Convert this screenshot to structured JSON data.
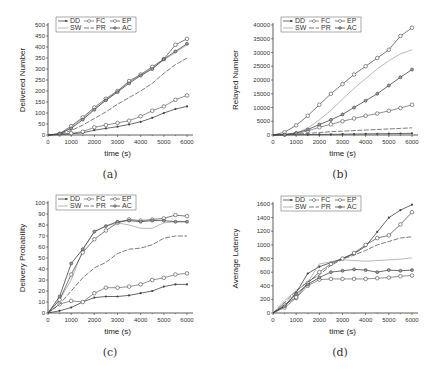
{
  "chart_data": [
    {
      "id": "a",
      "type": "line",
      "caption": "(a)",
      "xlabel": "time (s)",
      "ylabel": "Delivered Number",
      "x": [
        0,
        500,
        1000,
        1500,
        2000,
        2500,
        3000,
        3500,
        4000,
        4500,
        5000,
        5500,
        6000
      ],
      "xticks": [
        0,
        1000,
        2000,
        3000,
        4000,
        5000,
        6000
      ],
      "yticks": [
        0,
        50,
        100,
        150,
        200,
        250,
        300,
        350,
        400,
        450,
        500
      ],
      "xlim": [
        0,
        6000
      ],
      "ylim": [
        0,
        500
      ],
      "legend": [
        "DD",
        "SW",
        "FC",
        "PR",
        "EP",
        "AC"
      ],
      "series": [
        {
          "name": "DD",
          "marker": "star",
          "values": [
            0,
            2,
            5,
            10,
            22,
            30,
            38,
            48,
            60,
            78,
            100,
            118,
            130
          ]
        },
        {
          "name": "SW",
          "marker": "none",
          "values": [
            0,
            5,
            35,
            75,
            118,
            160,
            200,
            240,
            272,
            305,
            340,
            375,
            410
          ]
        },
        {
          "name": "FC",
          "marker": "circle",
          "values": [
            0,
            3,
            8,
            15,
            35,
            45,
            55,
            65,
            85,
            110,
            130,
            160,
            180
          ]
        },
        {
          "name": "PR",
          "marker": "dash",
          "values": [
            0,
            3,
            20,
            45,
            75,
            105,
            140,
            170,
            200,
            235,
            280,
            320,
            350
          ]
        },
        {
          "name": "EP",
          "marker": "circle",
          "values": [
            0,
            6,
            40,
            80,
            125,
            165,
            200,
            245,
            275,
            310,
            345,
            410,
            437
          ]
        },
        {
          "name": "AC",
          "marker": "diamond",
          "values": [
            0,
            5,
            30,
            70,
            115,
            158,
            195,
            235,
            270,
            300,
            345,
            380,
            415
          ]
        }
      ]
    },
    {
      "id": "b",
      "type": "line",
      "caption": "(b)",
      "xlabel": "time (s)",
      "ylabel": "Relayed Number",
      "x": [
        0,
        500,
        1000,
        1500,
        2000,
        2500,
        3000,
        3500,
        4000,
        4500,
        5000,
        5500,
        6000
      ],
      "xticks": [
        0,
        1000,
        2000,
        3000,
        4000,
        5000,
        6000
      ],
      "yticks": [
        0,
        5000,
        10000,
        15000,
        20000,
        25000,
        30000,
        35000,
        40000
      ],
      "xlim": [
        0,
        6000
      ],
      "ylim": [
        0,
        40000
      ],
      "legend": [
        "DD",
        "SW",
        "FC",
        "PR",
        "EP",
        "AC"
      ],
      "series": [
        {
          "name": "DD",
          "marker": "star",
          "values": [
            0,
            50,
            100,
            150,
            200,
            250,
            300,
            350,
            400,
            450,
            500,
            550,
            600
          ]
        },
        {
          "name": "SW",
          "marker": "none",
          "values": [
            0,
            200,
            800,
            2500,
            5500,
            9000,
            13000,
            17000,
            20500,
            24000,
            27000,
            29500,
            31000
          ]
        },
        {
          "name": "FC",
          "marker": "circle",
          "values": [
            0,
            100,
            500,
            1500,
            2800,
            3900,
            5000,
            6000,
            7000,
            7800,
            8800,
            9800,
            11000
          ]
        },
        {
          "name": "PR",
          "marker": "dash",
          "values": [
            0,
            80,
            300,
            600,
            900,
            1200,
            1400,
            1600,
            1800,
            2000,
            2200,
            2400,
            2600
          ]
        },
        {
          "name": "EP",
          "marker": "circle",
          "values": [
            0,
            1000,
            3500,
            7000,
            11000,
            15000,
            18500,
            22000,
            25000,
            28000,
            31000,
            36000,
            39000
          ]
        },
        {
          "name": "AC",
          "marker": "diamond",
          "values": [
            0,
            150,
            700,
            2000,
            3800,
            5500,
            7500,
            10000,
            12500,
            15000,
            18000,
            21000,
            23800
          ]
        }
      ]
    },
    {
      "id": "c",
      "type": "line",
      "caption": "(c)",
      "xlabel": "time (s)",
      "ylabel": "Delivery Probability",
      "x": [
        0,
        500,
        1000,
        1500,
        2000,
        2500,
        3000,
        3500,
        4000,
        4500,
        5000,
        5500,
        6000
      ],
      "xticks": [
        0,
        1000,
        2000,
        3000,
        4000,
        5000,
        6000
      ],
      "yticks": [
        0,
        10,
        20,
        30,
        40,
        50,
        60,
        70,
        80,
        90,
        100
      ],
      "xlim": [
        0,
        6000
      ],
      "ylim": [
        0,
        100
      ],
      "legend": [
        "DD",
        "SW",
        "FC",
        "PR",
        "EP",
        "AC"
      ],
      "series": [
        {
          "name": "DD",
          "marker": "star",
          "values": [
            0,
            2,
            5,
            10,
            14,
            15,
            15,
            16,
            18,
            20,
            24,
            26,
            26
          ]
        },
        {
          "name": "SW",
          "marker": "none",
          "values": [
            0,
            12,
            30,
            57,
            74,
            79,
            82,
            80,
            77,
            77,
            82,
            83,
            83
          ]
        },
        {
          "name": "FC",
          "marker": "circle",
          "values": [
            0,
            8,
            11,
            10,
            18,
            23,
            23,
            24,
            26,
            30,
            32,
            35,
            36
          ]
        },
        {
          "name": "PR",
          "marker": "dash",
          "values": [
            0,
            8,
            20,
            32,
            41,
            46,
            54,
            58,
            59,
            62,
            68,
            70,
            70
          ]
        },
        {
          "name": "EP",
          "marker": "circle",
          "values": [
            0,
            12,
            35,
            55,
            67,
            75,
            82,
            85,
            84,
            85,
            86,
            89,
            88
          ]
        },
        {
          "name": "AC",
          "marker": "diamond",
          "values": [
            0,
            15,
            45,
            58,
            74,
            79,
            83,
            84,
            83,
            84,
            84,
            83,
            83
          ]
        }
      ]
    },
    {
      "id": "d",
      "type": "line",
      "caption": "(d)",
      "xlabel": "time (s)",
      "ylabel": "Average Latency",
      "x": [
        0,
        500,
        1000,
        1500,
        2000,
        2500,
        3000,
        3500,
        4000,
        4500,
        5000,
        5500,
        6000
      ],
      "xticks": [
        0,
        1000,
        2000,
        3000,
        4000,
        5000,
        6000
      ],
      "yticks": [
        0,
        200,
        400,
        600,
        800,
        1000,
        1200,
        1400,
        1600
      ],
      "xlim": [
        0,
        6000
      ],
      "ylim": [
        0,
        1600
      ],
      "legend": [
        "DD",
        "SW",
        "FC",
        "PR",
        "EP",
        "AC"
      ],
      "series": [
        {
          "name": "DD",
          "marker": "star",
          "values": [
            0,
            100,
            300,
            580,
            680,
            740,
            800,
            870,
            980,
            1190,
            1400,
            1510,
            1590
          ]
        },
        {
          "name": "SW",
          "marker": "none",
          "values": [
            0,
            180,
            330,
            450,
            720,
            750,
            780,
            770,
            760,
            770,
            780,
            790,
            810
          ]
        },
        {
          "name": "FC",
          "marker": "circle",
          "values": [
            0,
            80,
            220,
            400,
            490,
            500,
            500,
            500,
            500,
            510,
            520,
            540,
            550
          ]
        },
        {
          "name": "PR",
          "marker": "dash",
          "values": [
            0,
            150,
            320,
            460,
            560,
            700,
            790,
            850,
            920,
            1000,
            1050,
            1100,
            1120
          ]
        },
        {
          "name": "EP",
          "marker": "circle",
          "values": [
            0,
            120,
            230,
            440,
            600,
            720,
            800,
            880,
            1000,
            1100,
            1140,
            1300,
            1480
          ]
        },
        {
          "name": "AC",
          "marker": "diamond",
          "values": [
            0,
            100,
            280,
            420,
            520,
            600,
            620,
            640,
            630,
            600,
            630,
            620,
            630
          ]
        }
      ]
    }
  ]
}
